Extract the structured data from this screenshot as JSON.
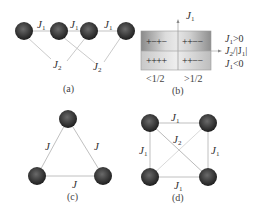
{
  "figure": {
    "panels": {
      "a": {
        "caption": "(a)",
        "coupling_nn": "J",
        "coupling_nn_sub": "1",
        "coupling_nnn": "J",
        "coupling_nnn_sub": "2",
        "sphere_count": 4
      },
      "b": {
        "caption": "(b)",
        "y_axis_label": "J",
        "y_axis_sub": "1",
        "x_axis_label_main": "J",
        "x_axis_label_sub": "2",
        "x_axis_label_rest": "/|J",
        "x_axis_label_sub2": "1",
        "x_axis_label_end": "|",
        "upper_label_main": "J",
        "upper_label_sub": "1",
        "upper_label_rest": ">0",
        "lower_label_main": "J",
        "lower_label_sub": "1",
        "lower_label_rest": "<0",
        "x_tick_left": "<1/2",
        "x_tick_right": ">1/2",
        "cells": {
          "top_left": "+−+−",
          "top_right": "++−−",
          "bottom_left": "++++",
          "bottom_right": "++−−"
        }
      },
      "c": {
        "caption": "(c)",
        "coupling": "J",
        "sphere_count": 3
      },
      "d": {
        "caption": "(d)",
        "coupling_edge": "J",
        "coupling_edge_sub": "1",
        "coupling_diag": "J",
        "coupling_diag_sub": "2",
        "sphere_count": 4
      }
    },
    "colors": {
      "sphere_dark": "#2e2e2e",
      "sphere_mid": "#5a5a5a",
      "sphere_light": "#8a8a8a",
      "line": "#b8b8b8",
      "box_dark": "#8c8c8c",
      "box_light": "#e6e6e6"
    }
  }
}
